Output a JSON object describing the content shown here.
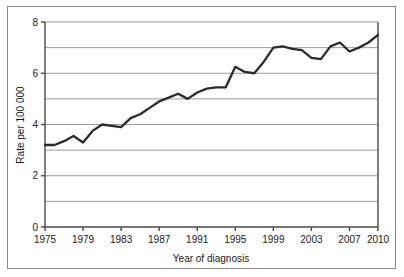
{
  "chart_data": {
    "type": "line",
    "title": "",
    "xlabel": "Year of diagnosis",
    "ylabel": "Rate per 100 000",
    "xlim": [
      1975,
      2010
    ],
    "ylim": [
      0,
      8
    ],
    "ytick_labels": [
      "0",
      "2",
      "4",
      "6",
      "8"
    ],
    "yticks": [
      0,
      2,
      4,
      6,
      8
    ],
    "gridlines_y": [
      1,
      2,
      3,
      4,
      5,
      6,
      7,
      8
    ],
    "grid": "horizontal",
    "legend": "none",
    "xtick_labels": [
      "1975",
      "1979",
      "1983",
      "1987",
      "1991",
      "1995",
      "1999",
      "2003",
      "2007",
      "2010"
    ],
    "xticks": [
      1975,
      1979,
      1983,
      1987,
      1991,
      1995,
      1999,
      2003,
      2007,
      2010
    ],
    "series": [
      {
        "name": "Rate per 100 000",
        "color": "#2b2b2b",
        "x": [
          1975,
          1976,
          1977,
          1978,
          1979,
          1980,
          1981,
          1982,
          1983,
          1984,
          1985,
          1986,
          1987,
          1988,
          1989,
          1990,
          1991,
          1992,
          1993,
          1994,
          1995,
          1996,
          1997,
          1998,
          1999,
          2000,
          2001,
          2002,
          2003,
          2004,
          2005,
          2006,
          2007,
          2008,
          2009,
          2010
        ],
        "values": [
          3.2,
          3.2,
          3.35,
          3.55,
          3.3,
          3.75,
          4.0,
          3.95,
          3.9,
          4.25,
          4.4,
          4.65,
          4.9,
          5.05,
          5.2,
          5.0,
          5.25,
          5.4,
          5.45,
          5.45,
          6.25,
          6.05,
          6.0,
          6.45,
          7.0,
          7.05,
          6.95,
          6.9,
          6.6,
          6.55,
          7.05,
          7.2,
          6.85,
          7.0,
          7.2,
          7.5
        ]
      }
    ]
  },
  "axis": {
    "y_label": "Rate per 100 000",
    "x_label": "Year of diagnosis"
  }
}
